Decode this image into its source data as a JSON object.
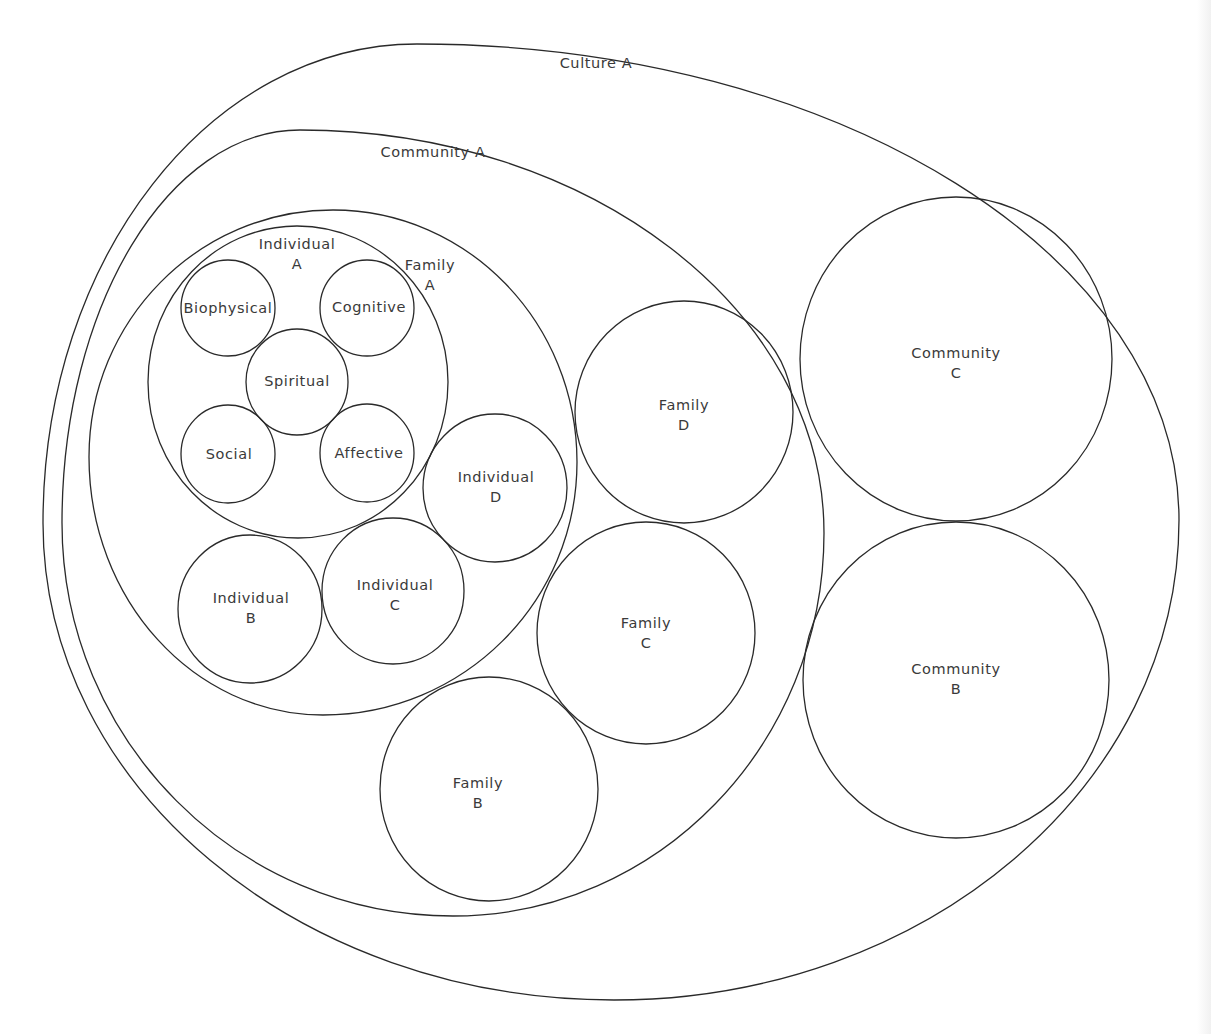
{
  "diagram": {
    "type": "nested-circles",
    "colors": {
      "stroke": "#2a2a2a",
      "text": "#3a3a3a",
      "background": "#ffffff"
    },
    "nodes": [
      {
        "id": "culture-a",
        "label_lines": [
          "Culture A"
        ],
        "parent": null
      },
      {
        "id": "community-a",
        "label_lines": [
          "Community A"
        ],
        "parent": "culture-a"
      },
      {
        "id": "community-b",
        "label_lines": [
          "Community",
          "B"
        ],
        "parent": "culture-a"
      },
      {
        "id": "community-c",
        "label_lines": [
          "Community",
          "C"
        ],
        "parent": "culture-a"
      },
      {
        "id": "family-a",
        "label_lines": [
          "Family",
          "A"
        ],
        "parent": "community-a"
      },
      {
        "id": "family-b",
        "label_lines": [
          "Family",
          "B"
        ],
        "parent": "community-a"
      },
      {
        "id": "family-c",
        "label_lines": [
          "Family",
          "C"
        ],
        "parent": "community-a"
      },
      {
        "id": "family-d",
        "label_lines": [
          "Family",
          "D"
        ],
        "parent": "community-a"
      },
      {
        "id": "individual-a",
        "label_lines": [
          "Individual",
          "A"
        ],
        "parent": "family-a"
      },
      {
        "id": "individual-b",
        "label_lines": [
          "Individual",
          "B"
        ],
        "parent": "family-a"
      },
      {
        "id": "individual-c",
        "label_lines": [
          "Individual",
          "C"
        ],
        "parent": "family-a"
      },
      {
        "id": "individual-d",
        "label_lines": [
          "Individual",
          "D"
        ],
        "parent": "family-a"
      },
      {
        "id": "biophysical",
        "label_lines": [
          "Biophysical"
        ],
        "parent": "individual-a"
      },
      {
        "id": "cognitive",
        "label_lines": [
          "Cognitive"
        ],
        "parent": "individual-a"
      },
      {
        "id": "spiritual",
        "label_lines": [
          "Spiritual"
        ],
        "parent": "individual-a"
      },
      {
        "id": "social",
        "label_lines": [
          "Social"
        ],
        "parent": "individual-a"
      },
      {
        "id": "affective",
        "label_lines": [
          "Affective"
        ],
        "parent": "individual-a"
      }
    ]
  }
}
